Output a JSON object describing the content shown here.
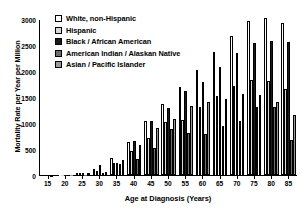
{
  "chart_data": {
    "type": "bar",
    "title": "",
    "xlabel": "Age at Diagnosis (Years)",
    "ylabel": "Mortality Rate per Year per Million",
    "ylim": [
      0,
      3000
    ],
    "yticks": [
      0,
      500,
      1000,
      1500,
      2000,
      2500,
      3000
    ],
    "xticks": [
      15,
      20,
      25,
      30,
      35,
      40,
      45,
      50,
      55,
      60,
      65,
      70,
      75,
      80,
      85
    ],
    "grid": false,
    "legend_position": "top-left",
    "categories": [
      "15",
      "20",
      "25",
      "30",
      "35",
      "40",
      "45",
      "50",
      "55",
      "60",
      "65",
      "70",
      "75",
      "80",
      "85"
    ],
    "series": [
      {
        "name": "White, non-Hispanic",
        "color": "#ffffff",
        "values": [
          0,
          4,
          18,
          110,
          330,
          640,
          1030,
          1370,
          1690,
          2020,
          2360,
          2680,
          2970,
          3020,
          2920
        ]
      },
      {
        "name": "Hispanic",
        "color": "#d9d9d9",
        "values": [
          0,
          2,
          10,
          75,
          240,
          460,
          720,
          1010,
          1060,
          1300,
          1510,
          1720,
          1830,
          1810,
          1660
        ]
      },
      {
        "name": "Black / African American",
        "color": "#1a1a1a",
        "values": [
          0,
          3,
          14,
          195,
          225,
          650,
          1030,
          1290,
          1610,
          1790,
          2080,
          2340,
          2540,
          2570,
          2560
        ]
      },
      {
        "name": "American Indian / Alaskan Native",
        "color": "#6e6e6e",
        "values": [
          0,
          1,
          6,
          40,
          205,
          300,
          520,
          880,
          800,
          790,
          940,
          1040,
          1310,
          1300,
          670
        ]
      },
      {
        "name": "Asian / Pacific Islander",
        "color": "#9a9a9a",
        "values": [
          0,
          2,
          8,
          60,
          290,
          570,
          900,
          1070,
          1320,
          1400,
          1470,
          1550,
          1540,
          1400,
          1160
        ]
      }
    ]
  },
  "legend": {
    "items": [
      {
        "label": "White, non-Hispanic",
        "swatch": "#ffffff"
      },
      {
        "label": "Hispanic",
        "swatch": "#d9d9d9"
      },
      {
        "label": "Black / African American",
        "swatch": "#1a1a1a"
      },
      {
        "label": "American Indian / Alaskan Native",
        "swatch": "#6e6e6e"
      },
      {
        "label": "Asian / Pacific Islander",
        "swatch": "#9a9a9a"
      }
    ]
  }
}
